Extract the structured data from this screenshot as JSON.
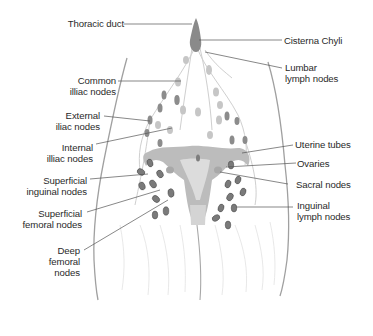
{
  "diagram": {
    "colors": {
      "text": "#2a2a2a",
      "leader_line": "#555555",
      "node_fill": "#7a7a7a",
      "node_light": "#c4c4c4",
      "organ_fill": "#b8b8b8",
      "outline": "#9a9a9a"
    },
    "labels_left": [
      {
        "id": "thoracic-duct",
        "lines": [
          "Thoracic duct"
        ]
      },
      {
        "id": "common-iliac-nodes",
        "lines": [
          "Common",
          "illiac nodes"
        ]
      },
      {
        "id": "external-iliac-nodes",
        "lines": [
          "External",
          "iliac nodes"
        ]
      },
      {
        "id": "internal-iliac-nodes",
        "lines": [
          "Internal",
          "illiac nodes"
        ]
      },
      {
        "id": "superficial-inguinal-nodes",
        "lines": [
          "Superficial",
          "inguinal nodes"
        ]
      },
      {
        "id": "superficial-femoral-nodes",
        "lines": [
          "Superficial",
          "femoral nodes"
        ]
      },
      {
        "id": "deep-femoral-nodes",
        "lines": [
          "Deep",
          "femoral",
          "nodes"
        ]
      }
    ],
    "labels_right": [
      {
        "id": "cisterna-chyli",
        "lines": [
          "Cisterna Chyli"
        ]
      },
      {
        "id": "lumbar-lymph-nodes",
        "lines": [
          "Lumbar",
          "lymph nodes"
        ]
      },
      {
        "id": "uterine-tubes",
        "lines": [
          "Uterine tubes"
        ]
      },
      {
        "id": "ovaries",
        "lines": [
          "Ovaries"
        ]
      },
      {
        "id": "sacral-nodes",
        "lines": [
          "Sacral nodes"
        ]
      },
      {
        "id": "inguinal-lymph-nodes",
        "lines": [
          "Inguinal",
          "lymph nodes"
        ]
      }
    ]
  }
}
